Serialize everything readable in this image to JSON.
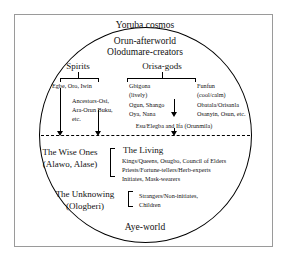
{
  "diagram": {
    "title": "Yoruba cosmos",
    "bottom_label": "Aye-world",
    "realm": {
      "line1": "Orun-afterworld",
      "line2": "Olodumare-creators"
    },
    "branches": {
      "spirits": {
        "heading": "Spirits",
        "items": [
          "Egbe, Oro, Iwin",
          "Ancestors-Osi,",
          "Ara-Orun Buku,",
          "etc."
        ]
      },
      "orisa": {
        "heading": "Orisa-gods",
        "hot": {
          "name": "Gbigona",
          "temper": "(lively)",
          "deities_line1": "Ogun, Shango",
          "deities_line2": "Oya, Nana"
        },
        "cool": {
          "name": "Funfun",
          "temper": "(cool/calm)",
          "deities_line1": "Obatala/Orisanla",
          "deities_line2": "Osanyin, Osun, etc."
        }
      }
    },
    "mediators": "Esu/Elegba and Ifa (Orunmila)",
    "living_world": {
      "wise_ones": {
        "line1": "The Wise Ones",
        "line2": "(Alawo, Alase)"
      },
      "the_living": {
        "heading": "The Living",
        "items": [
          "Kings/Queens, Osugbo, Council of Elders",
          "Priests/Fortune-tellers/Herb-experts",
          "Initiates, Mask-wearers"
        ]
      },
      "unknowing": {
        "line1": "The Unknowing",
        "line2": "(Ologberi)",
        "items": [
          "Strangers/Non-initiates,",
          "Children"
        ]
      }
    },
    "colors": {
      "ink": "#000000",
      "frame": "#9a9a9a",
      "background": "#ffffff"
    }
  }
}
